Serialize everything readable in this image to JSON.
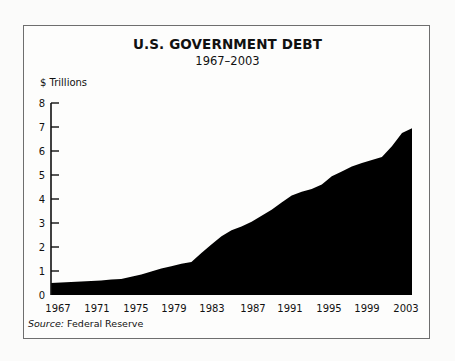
{
  "chart": {
    "title": "U.S. GOVERNMENT DEBT",
    "subtitle": "1967–2003",
    "ylabel": "$ Trillions",
    "source_label": "Source:",
    "source_text": " Federal Reserve"
  },
  "chart_data": {
    "type": "area",
    "title": "U.S. GOVERNMENT DEBT",
    "subtitle": "1967–2003",
    "xlabel": "",
    "ylabel": "$ Trillions",
    "ylim": [
      0,
      8
    ],
    "xlim": [
      1967,
      2003
    ],
    "y_ticks": [
      0,
      1,
      2,
      3,
      4,
      5,
      6,
      7,
      8
    ],
    "x_tick_labels": [
      "1967",
      "1971",
      "1975",
      "1979",
      "1983",
      "1987",
      "1991",
      "1995",
      "1999",
      "2003"
    ],
    "grid": false,
    "legend": null,
    "fill_color": "#000000",
    "source": "Source: Federal Reserve",
    "series": [
      {
        "name": "U.S. Government Debt",
        "x": [
          1967,
          1968,
          1969,
          1970,
          1971,
          1972,
          1973,
          1974,
          1975,
          1976,
          1977,
          1978,
          1979,
          1980,
          1981,
          1982,
          1983,
          1984,
          1985,
          1986,
          1987,
          1988,
          1989,
          1990,
          1991,
          1992,
          1993,
          1994,
          1995,
          1996,
          1997,
          1998,
          1999,
          2000,
          2001,
          2002,
          2003
        ],
        "values": [
          0.5,
          0.52,
          0.54,
          0.56,
          0.58,
          0.61,
          0.64,
          0.67,
          0.76,
          0.85,
          0.98,
          1.1,
          1.2,
          1.3,
          1.38,
          1.75,
          2.1,
          2.45,
          2.7,
          2.85,
          3.05,
          3.3,
          3.55,
          3.85,
          4.15,
          4.3,
          4.42,
          4.6,
          4.95,
          5.15,
          5.35,
          5.5,
          5.62,
          5.75,
          6.2,
          6.75,
          6.95
        ]
      }
    ]
  }
}
